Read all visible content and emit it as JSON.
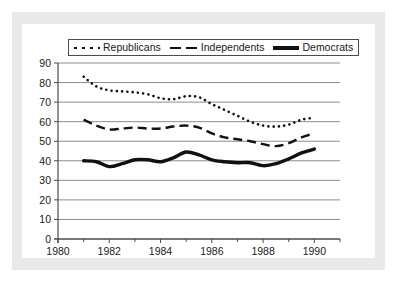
{
  "chart_data": {
    "type": "line",
    "title": "",
    "xlabel": "",
    "ylabel": "",
    "xlim": [
      1980,
      1991
    ],
    "ylim": [
      0,
      90
    ],
    "ytick_step": 10,
    "yticks": [
      0,
      10,
      20,
      30,
      40,
      50,
      60,
      70,
      80,
      90
    ],
    "xticks_major": [
      1980,
      1982,
      1984,
      1986,
      1988,
      1990
    ],
    "xticks_minor": [
      1981,
      1983,
      1985,
      1987,
      1989,
      1991
    ],
    "grid": "horizontal",
    "legend_position": "top",
    "x": [
      1981,
      1981.5,
      1982,
      1982.5,
      1983,
      1983.5,
      1984,
      1984.5,
      1985,
      1985.5,
      1986,
      1986.5,
      1987,
      1987.5,
      1988,
      1988.5,
      1989,
      1989.5,
      1990
    ],
    "series": [
      {
        "name": "Republicans",
        "style": "dotted",
        "color": "#111111",
        "values": [
          83,
          78,
          76,
          75.5,
          75,
          74,
          72,
          71.5,
          73,
          72.5,
          69,
          66,
          63,
          60,
          58,
          57.5,
          58.5,
          61,
          62
        ]
      },
      {
        "name": "Independents",
        "style": "dashed",
        "color": "#111111",
        "values": [
          61,
          58,
          56,
          56.5,
          57,
          56.5,
          56.5,
          57.5,
          58,
          57,
          54,
          52,
          51,
          50,
          48.5,
          47.5,
          49,
          52,
          54
        ]
      },
      {
        "name": "Democrats",
        "style": "solid",
        "color": "#111111",
        "values": [
          40,
          39.5,
          37,
          38.5,
          40.5,
          40.5,
          39.5,
          41.5,
          44.5,
          43,
          40.5,
          39.5,
          39,
          39,
          37.5,
          38.5,
          41,
          44,
          46
        ]
      }
    ]
  },
  "legend": {
    "items": [
      {
        "label": "Republicans",
        "swatch": "dotted-line-swatch"
      },
      {
        "label": "Independents",
        "swatch": "dashed-line-swatch"
      },
      {
        "label": "Democrats",
        "swatch": "solid-line-swatch"
      }
    ]
  },
  "axes": {
    "y_tick_labels": [
      "90",
      "80",
      "70",
      "60",
      "50",
      "40",
      "30",
      "20",
      "10",
      "0"
    ],
    "x_tick_labels": [
      "1980",
      "1982",
      "1984",
      "1986",
      "1988",
      "1990"
    ]
  },
  "colors": {
    "line": "#111111",
    "grid": "#8d8d8d",
    "axis": "#4a4a4a",
    "frame": "#e9e9e9",
    "background": "#ffffff",
    "text": "#1a1a1a"
  }
}
